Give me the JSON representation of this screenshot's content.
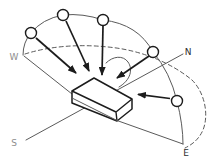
{
  "diagram": {
    "type": "sun-path-illustration",
    "compass": {
      "west": "W",
      "north": "N",
      "south": "S",
      "east": "E"
    },
    "sun_positions": 5,
    "elements": {
      "sky_dome_arc": "solid-arc-through-sun-circles",
      "horizon_arc": "dashed-horizon-arc",
      "surface": "tilted-rectangular-slab",
      "rays": "sun-ray-arrows",
      "rotation_arc": "azimuth-rotation-arc"
    },
    "colors": {
      "background": "#ffffff",
      "thin_line": "#5a5a5a",
      "bold_line": "#1c1c1c",
      "muted_label": "#8d8d8d",
      "dark_label": "#2e2e2e"
    }
  }
}
